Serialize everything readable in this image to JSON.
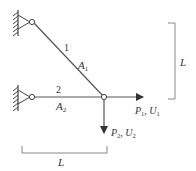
{
  "diagram": {
    "type": "two-bar truss",
    "colors": {
      "line": "#555555",
      "text": "#333333",
      "bracket": "#888888"
    },
    "bars": [
      {
        "id": "1",
        "number_label": "1",
        "area_label": "A",
        "area_sub": "1"
      },
      {
        "id": "2",
        "number_label": "2",
        "area_label": "A",
        "area_sub": "2"
      }
    ],
    "loads": [
      {
        "id": "horizontal",
        "P": "P",
        "P_sub": "1",
        "sep": ", ",
        "U": "U",
        "U_sub": "1"
      },
      {
        "id": "vertical",
        "P": "P",
        "P_sub": "2",
        "sep": ", ",
        "U": "U",
        "U_sub": "2"
      }
    ],
    "dimensions": {
      "horizontal": {
        "label": "L"
      },
      "vertical": {
        "label": "L"
      }
    }
  }
}
